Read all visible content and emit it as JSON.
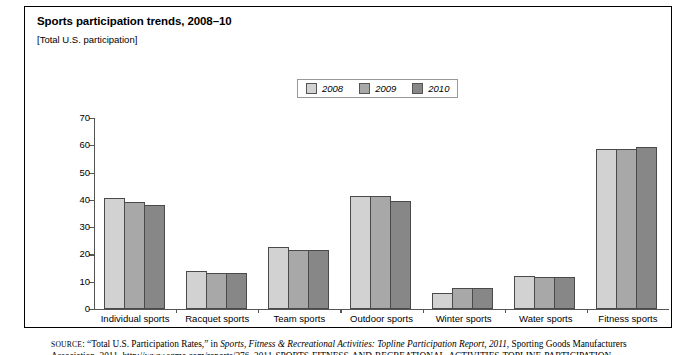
{
  "figure": {
    "title": "Sports participation trends, 2008–10",
    "subtitle": "[Total U.S. participation]"
  },
  "source": {
    "prefix": "SOURCE",
    "line1_a": ": “Total U.S. Participation Rates,” in ",
    "line1_italic": "Sports, Fitness & Recreational Activities: Topline Participation Report, 2011",
    "line1_b": ", Sporting Goods Manufacturers",
    "line2": "Association, 2011, http://www.sgma.com/reports/276_2011-SPORTS-FITNESS-AND-RECREATIONAL-ACTIVITIES-TOPLINE-PARTICIPATION"
  },
  "legend": {
    "entries": [
      {
        "label": "2008",
        "color": "#d2d2d2"
      },
      {
        "label": "2009",
        "color": "#a8a8a8"
      },
      {
        "label": "2010",
        "color": "#878787"
      }
    ]
  },
  "chart_data": {
    "type": "bar",
    "title": "Sports participation trends, 2008–10",
    "subtitle": "[Total U.S. participation]",
    "xlabel": "",
    "ylabel": "Percent",
    "ylim": [
      0,
      70
    ],
    "yticks": [
      0,
      10,
      20,
      30,
      40,
      50,
      60,
      70
    ],
    "grid": false,
    "legend_position": "top-center",
    "categories": [
      "Individual sports",
      "Racquet sports",
      "Team sports",
      "Outdoor sports",
      "Winter sports",
      "Water sports",
      "Fitness sports"
    ],
    "series": [
      {
        "name": "2008",
        "color": "#d2d2d2",
        "values": [
          40.7,
          13.8,
          22.7,
          41.3,
          6.0,
          12.2,
          58.7
        ]
      },
      {
        "name": "2009",
        "color": "#a8a8a8",
        "values": [
          39.4,
          13.2,
          21.7,
          41.3,
          7.7,
          11.8,
          58.7
        ]
      },
      {
        "name": "2010",
        "color": "#878787",
        "values": [
          38.0,
          13.2,
          21.7,
          39.6,
          7.7,
          11.6,
          59.2
        ]
      }
    ]
  }
}
